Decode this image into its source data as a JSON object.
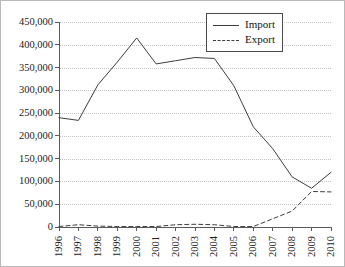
{
  "chart_data": {
    "type": "line",
    "title": "",
    "subtitle": "",
    "xlabel": "",
    "ylabel": "",
    "categories": [
      "1996",
      "1997",
      "1998",
      "1999",
      "2000",
      "2001",
      "2002",
      "2003",
      "2004",
      "2005",
      "2006",
      "2007",
      "2008",
      "2009",
      "2010"
    ],
    "series": [
      {
        "name": "Import",
        "style": "solid",
        "color": "#3d3d3d",
        "values": [
          240000,
          234000,
          312000,
          362000,
          415000,
          358000,
          365000,
          372000,
          370000,
          310000,
          220000,
          172000,
          110000,
          85000,
          120000
        ]
      },
      {
        "name": "Export",
        "style": "dashed",
        "color": "#3d3d3d",
        "values": [
          1000,
          5000,
          2000,
          1000,
          1000,
          1000,
          5000,
          6000,
          5000,
          1000,
          1000,
          18000,
          35000,
          78000,
          77000
        ]
      }
    ],
    "ylim": [
      0,
      450000
    ],
    "xlim": [
      "1996",
      "2010"
    ],
    "y_ticks": [
      0,
      50000,
      100000,
      150000,
      200000,
      250000,
      300000,
      350000,
      400000,
      450000
    ],
    "y_tick_labels": [
      "0",
      "50,000",
      "100,000",
      "150,000",
      "200,000",
      "250,000",
      "300,000",
      "350,000",
      "400,000",
      "450,000"
    ],
    "grid": "horizontal-dotted",
    "legend_position": "top-right",
    "legend_entries": [
      "Import",
      "Export"
    ]
  }
}
